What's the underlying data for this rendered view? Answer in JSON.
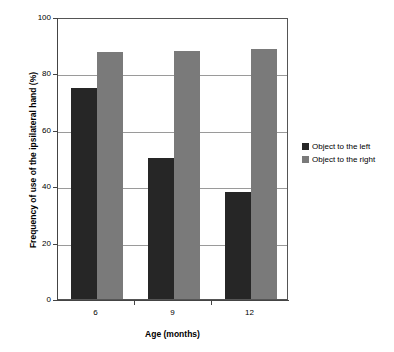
{
  "chart_data": {
    "type": "bar",
    "title": "",
    "subtitle": "",
    "categories": [
      "6",
      "9",
      "12"
    ],
    "series": [
      {
        "name": "Object to the left",
        "values": [
          75,
          50,
          38
        ],
        "color": "#262626"
      },
      {
        "name": "Object to the right",
        "values": [
          87.5,
          88,
          88.5
        ],
        "color": "#7a7a7a"
      }
    ],
    "xlabel": "Age (months)",
    "ylabel": "Frequency of use of the ipsilateral hand (%)",
    "ylim": [
      0,
      100
    ],
    "yticks": [
      0,
      20,
      40,
      60,
      80,
      100
    ],
    "ytick_labels": [
      "0",
      "20",
      "40",
      "60",
      "80",
      "100"
    ],
    "xtick_labels": [
      "6",
      "9",
      "12"
    ],
    "grid": "horizontal",
    "legend_position": "right",
    "plot_border": true
  },
  "axes": {
    "y_title": "Frequency of use of the ipsilateral hand (%)",
    "x_title": "Age (months)"
  },
  "legend": {
    "items": [
      {
        "label": "Object to the left",
        "color": "#262626"
      },
      {
        "label": "Object to the right",
        "color": "#7a7a7a"
      }
    ]
  },
  "colors": {
    "series_left": "#262626",
    "series_right": "#7a7a7a",
    "gridline": "#9a9a9a",
    "axis": "#444444",
    "background": "#ffffff"
  }
}
